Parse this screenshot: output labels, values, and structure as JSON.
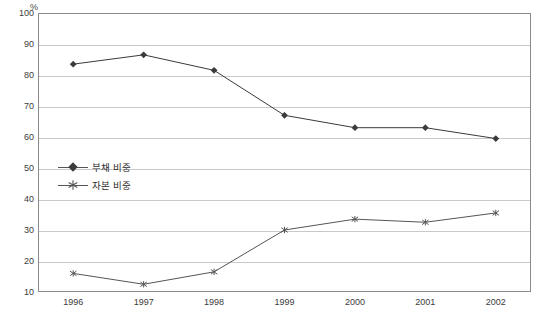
{
  "chart_data": {
    "type": "line",
    "title": "",
    "xlabel": "",
    "ylabel": "%",
    "unit_label": "%",
    "categories": [
      "1996",
      "1997",
      "1998",
      "1999",
      "2000",
      "2001",
      "2002"
    ],
    "x": [
      1996,
      1997,
      1998,
      1999,
      2000,
      2001,
      2002
    ],
    "ylim": [
      10,
      100
    ],
    "y_ticks": [
      10,
      20,
      30,
      40,
      50,
      60,
      70,
      80,
      90,
      100
    ],
    "grid": true,
    "legend_position": "inside-left",
    "series": [
      {
        "name": "부채 비중",
        "marker": "diamond",
        "color": "#3b3b3b",
        "values": [
          83.5,
          86.5,
          81.5,
          67.0,
          63.0,
          63.0,
          59.5
        ]
      },
      {
        "name": "자본 비중",
        "marker": "asterisk",
        "color": "#555555",
        "values": [
          16.0,
          12.5,
          16.5,
          30.0,
          33.5,
          32.5,
          35.5
        ]
      }
    ]
  },
  "legend": {
    "items": [
      {
        "label": "부채 비중"
      },
      {
        "label": "자본 비중"
      }
    ]
  },
  "colors": {
    "frame": "#8a8a8a",
    "grid": "#c9c9c9",
    "series_1": "#3b3b3b",
    "series_2": "#555555",
    "text": "#3c3c3c",
    "background": "#ffffff"
  }
}
